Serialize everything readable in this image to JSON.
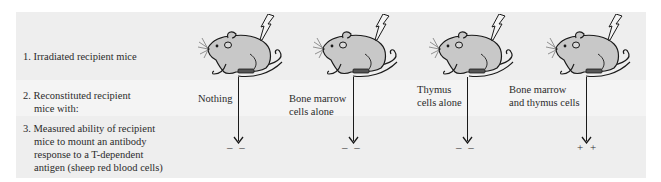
{
  "steps": [
    {
      "number": "1.",
      "text_first": "Irradiated recipient mice",
      "text_cont": ""
    },
    {
      "number": "2.",
      "text_first": "Reconstituted recipient",
      "text_cont": "mice with:"
    },
    {
      "number": "3.",
      "text_first": "Measured ability of recipient",
      "text_cont_lines": [
        "mice to mount an antibody",
        "response to a T-dependent",
        "antigen (sheep red blood cells)"
      ]
    }
  ],
  "groups": [
    {
      "reconstitution_line1": "Nothing",
      "reconstitution_line2": "",
      "result": "– –",
      "icon": "irradiated-mouse-icon"
    },
    {
      "reconstitution_line1": "Bone marrow",
      "reconstitution_line2": "cells alone",
      "result": "– –",
      "icon": "irradiated-mouse-icon"
    },
    {
      "reconstitution_line1": "Thymus",
      "reconstitution_line2": "cells alone",
      "result": "– –",
      "icon": "irradiated-mouse-icon"
    },
    {
      "reconstitution_line1": "Bone marrow",
      "reconstitution_line2": "and thymus cells",
      "result": "+ +",
      "icon": "irradiated-mouse-icon"
    }
  ],
  "colors": {
    "band_dark": "#eeeeee",
    "band_light": "#f4f4f4",
    "mouse_fill": "#c8c8c8",
    "outline": "#1a1a1a"
  }
}
